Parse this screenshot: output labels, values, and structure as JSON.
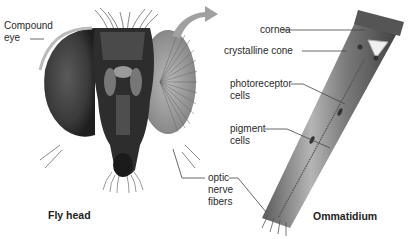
{
  "figure": {
    "left_panel": {
      "title": "Fly head",
      "labels": {
        "compound_eye_line1": "Compound",
        "compound_eye_line2": "eye",
        "optic_line1": "optic",
        "optic_line2": "nerve",
        "optic_line3": "fibers"
      }
    },
    "right_panel": {
      "title": "Ommatidium",
      "labels": {
        "cornea": "cornea",
        "crystalline_cone": "crystalline cone",
        "photoreceptor_line1": "photoreceptor",
        "photoreceptor_line2": "cells",
        "pigment_line1": "pigment",
        "pigment_line2": "cells"
      }
    },
    "colors": {
      "background": "#ffffff",
      "arrow": "#9a9a9a",
      "leader_lines": "#444444",
      "head_dark": "#2b2b2b",
      "eye_gray": "#6e6e6e",
      "ommatidium_body": "#8a8a8a"
    }
  }
}
